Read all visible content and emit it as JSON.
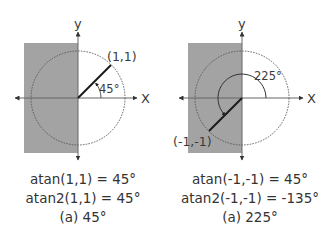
{
  "panels": [
    {
      "axis_x_label": "X",
      "axis_y_label": "y",
      "point_label": "(1,1)",
      "angle_label": "45°",
      "captions": {
        "line1": "atan(1,1) = 45°",
        "line2": "atan2(1,1) = 45°",
        "line3": "(a) 45°"
      }
    },
    {
      "axis_x_label": "X",
      "axis_y_label": "y",
      "point_label": "(-1,-1)",
      "angle_label": "225°",
      "captions": {
        "line1": "atan(-1,-1) = 45°",
        "line2": "atan2(-1,-1) = -135°",
        "line3": "(a) 225°"
      }
    }
  ],
  "colors": {
    "shade": "#a3a3a3",
    "axis": "#555555",
    "vector": "#1a1a1a",
    "circle": "#555555"
  }
}
